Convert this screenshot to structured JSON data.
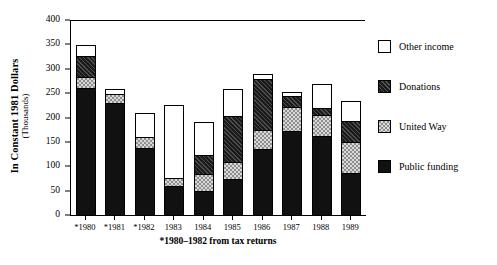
{
  "chart_data": {
    "type": "bar",
    "subtype": "stacked",
    "title": "",
    "xlabel": "",
    "ylabel": "In Constant 1981 Dollars",
    "ylabel_sub": "(Thousands)",
    "ylim": [
      0,
      400
    ],
    "yticks": [
      0,
      50,
      100,
      150,
      200,
      250,
      300,
      350,
      400
    ],
    "ytick_labels": [
      "0",
      "50",
      "100",
      "150",
      "200",
      "250",
      "300",
      "350",
      "400"
    ],
    "grid": false,
    "legend_position": "right",
    "footnote": "*1980–1982 from tax returns",
    "categories": [
      "*1980",
      "*1981",
      "*1982",
      "1983",
      "1984",
      "1985",
      "1986",
      "1987",
      "1988",
      "1989"
    ],
    "series": [
      {
        "name": "Public funding",
        "color": "#111111",
        "pattern": "solid-black",
        "values": [
          262,
          232,
          140,
          62,
          51,
          76,
          137,
          174,
          164,
          88
        ]
      },
      {
        "name": "United Way",
        "color": "#8f8f8f",
        "pattern": "checkerboard",
        "values": [
          25,
          20,
          24,
          18,
          37,
          37,
          41,
          52,
          45,
          66
        ]
      },
      {
        "name": "Donations",
        "color": "#1b1b1b",
        "pattern": "dark-hatch",
        "values": [
          46,
          0,
          0,
          0,
          41,
          96,
          107,
          24,
          16,
          45
        ]
      },
      {
        "name": "Other income",
        "color": "#ffffff",
        "pattern": "white",
        "values": [
          24,
          13,
          51,
          152,
          70,
          58,
          12,
          10,
          51,
          43
        ]
      }
    ],
    "totals": [
      357,
      265,
      215,
      232,
      199,
      267,
      297,
      260,
      276,
      242
    ]
  },
  "legend": {
    "items": [
      {
        "label": "Other income",
        "key": "other"
      },
      {
        "label": "Donations",
        "key": "donations"
      },
      {
        "label": "United Way",
        "key": "united"
      },
      {
        "label": "Public funding",
        "key": "public"
      }
    ]
  }
}
